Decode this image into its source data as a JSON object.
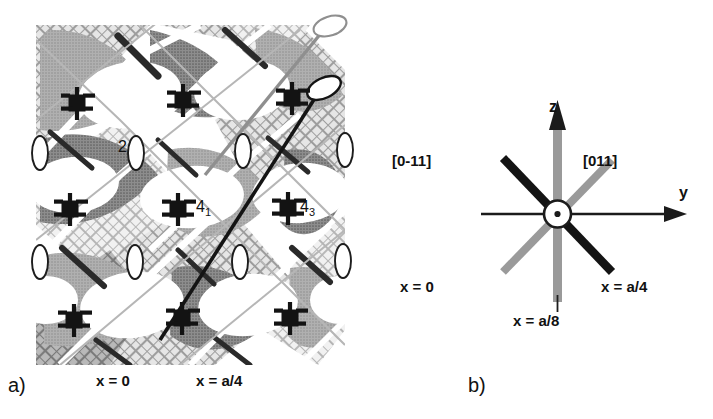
{
  "figure": {
    "type": "crystallographic-symmetry-diagram",
    "panels": [
      {
        "id": "a",
        "label": "a)"
      },
      {
        "id": "b",
        "label": "b)"
      }
    ]
  },
  "panel_a": {
    "label": "a)",
    "description": "Grayscale halftone micrograph-style map of a crystal plane overlaid with symmetry element symbols",
    "symmetry_labels": [
      {
        "name": "two-fold-axis",
        "text": "2"
      },
      {
        "name": "four-one-screw-axis",
        "text": "4",
        "subscript": "1"
      },
      {
        "name": "four-three-screw-axis",
        "text": "4",
        "subscript": "3"
      }
    ],
    "captions": [
      {
        "name": "x-equals-zero",
        "text": "x = 0"
      },
      {
        "name": "x-equals-a-over-4",
        "text": "x = a/4"
      }
    ],
    "screw_axis_symbol_count": 9,
    "twofold_ellipse_count": 8,
    "lollipop_axes": [
      {
        "name": "gray-lollipop-axis",
        "color": "#8c8c8c"
      },
      {
        "name": "black-lollipop-axis",
        "color": "#141414"
      }
    ]
  },
  "panel_b": {
    "label": "b)",
    "description": "Eight-armed star schematic of crystallographic directions viewed along the x axis",
    "axes": [
      {
        "name": "z-axis",
        "text": "z",
        "direction": "up",
        "arrow": true
      },
      {
        "name": "y-axis",
        "text": "y",
        "direction": "right",
        "arrow": true
      }
    ],
    "direction_labels": [
      {
        "name": "direction-0-minus-1-1",
        "text": "[0-11]",
        "color": "#141414"
      },
      {
        "name": "direction-011",
        "text": "[011]",
        "color": "#9a9a9a"
      }
    ],
    "plane_labels": [
      {
        "name": "x-equals-zero",
        "text": "x = 0",
        "color": "#9a9a9a"
      },
      {
        "name": "x-equals-a-over-4",
        "text": "x = a/4",
        "color": "#141414"
      },
      {
        "name": "x-equals-a-over-8",
        "text": "x = a/8",
        "color": "#9a9a9a"
      }
    ],
    "center": {
      "name": "x-axis-out-of-page",
      "symbol": "circled-dot"
    }
  },
  "colors": {
    "black": "#141414",
    "gray_bar": "#9a9a9a",
    "dark_gray": "#6e6e6e",
    "mid_gray": "#a8a8a8",
    "light_gray": "#cdcdcd",
    "pale_gray": "#e3e3e3",
    "background": "#ffffff"
  }
}
